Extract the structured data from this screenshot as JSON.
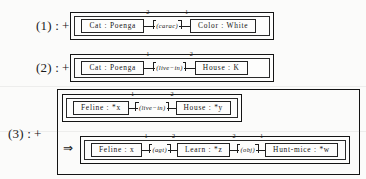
{
  "figure": {
    "type": "conceptual-graph-rules",
    "implies_symbol": "⇒",
    "plus_symbol": "+"
  },
  "rules": [
    {
      "label": "(1) :",
      "graphs": [
        {
          "nodes": [
            {
              "concept": "Cat : Poenga"
            },
            {
              "relation": "(carac)",
              "valence_left": "2",
              "valence_right": "1"
            },
            {
              "concept": "Color : White"
            }
          ]
        }
      ]
    },
    {
      "label": "(2) :",
      "graphs": [
        {
          "nodes": [
            {
              "concept": "Cat : Poenga"
            },
            {
              "relation": "(live−in)",
              "valence_left": "1",
              "valence_right": "2"
            },
            {
              "concept": "House : K"
            }
          ]
        }
      ]
    },
    {
      "label": "(3) :",
      "graphs": [
        {
          "nodes": [
            {
              "concept": "Feline : *x"
            },
            {
              "relation": "(live−in)",
              "valence_left": "1",
              "valence_right": "2"
            },
            {
              "concept": "House : *y"
            }
          ]
        },
        {
          "nodes": [
            {
              "concept": "Feline : x"
            },
            {
              "relation": "(agt)",
              "valence_left": "1",
              "valence_right": "2"
            },
            {
              "concept": "Learn : *z"
            },
            {
              "relation": "(obj)",
              "valence_left": "2",
              "valence_right": "1"
            },
            {
              "concept": "Hunt-mice : *w"
            }
          ]
        }
      ]
    }
  ]
}
